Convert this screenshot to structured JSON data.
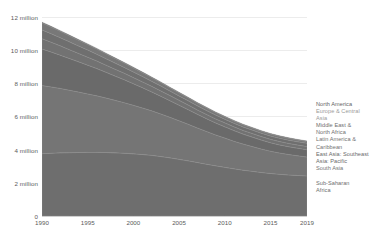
{
  "chart_data": {
    "type": "area",
    "title": "",
    "subtitle": "",
    "xlabel": "",
    "ylabel": "",
    "stacked": true,
    "grid": true,
    "legend_position": "right",
    "xlim": [
      1990,
      2019
    ],
    "ylim": [
      0,
      13000000
    ],
    "x_tick_labels": [
      "1990",
      "1995",
      "2000",
      "2005",
      "2010",
      "2015",
      "2019"
    ],
    "x_ticks": [
      1990,
      1995,
      2000,
      2005,
      2010,
      2015,
      2019
    ],
    "y_tick_labels": [
      "0",
      "2 million",
      "4 million",
      "6 million",
      "8 million",
      "10 million",
      "12 million"
    ],
    "y_ticks": [
      0,
      2000000,
      4000000,
      6000000,
      8000000,
      10000000,
      12000000
    ],
    "x": [
      1990,
      1991,
      1992,
      1993,
      1994,
      1995,
      1996,
      1997,
      1998,
      1999,
      2000,
      2001,
      2002,
      2003,
      2004,
      2005,
      2006,
      2007,
      2008,
      2009,
      2010,
      2011,
      2012,
      2013,
      2014,
      2015,
      2016,
      2017,
      2018,
      2019
    ],
    "series": [
      {
        "name": "Sub-Saharan Africa",
        "color": "#6e6e6e",
        "values": [
          3750000,
          3780000,
          3800000,
          3810000,
          3820000,
          3830000,
          3830000,
          3820000,
          3800000,
          3780000,
          3740000,
          3700000,
          3650000,
          3580000,
          3500000,
          3410000,
          3320000,
          3220000,
          3120000,
          3020000,
          2930000,
          2840000,
          2760000,
          2690000,
          2620000,
          2560000,
          2510000,
          2470000,
          2440000,
          2410000
        ]
      },
      {
        "name": "South Asia",
        "color": "#757575",
        "values": [
          4100000,
          3990000,
          3880000,
          3760000,
          3640000,
          3520000,
          3400000,
          3280000,
          3160000,
          3040000,
          2920000,
          2800000,
          2680000,
          2560000,
          2440000,
          2320000,
          2200000,
          2080000,
          1970000,
          1860000,
          1760000,
          1660000,
          1570000,
          1490000,
          1410000,
          1340000,
          1280000,
          1230000,
          1180000,
          1140000
        ]
      },
      {
        "name": "East Asia: Southeast Asia: Pacific",
        "color": "#6a6a6a",
        "values": [
          2200000,
          2100000,
          2000000,
          1910000,
          1820000,
          1730000,
          1640000,
          1550000,
          1460000,
          1380000,
          1300000,
          1220000,
          1140000,
          1070000,
          1000000,
          940000,
          880000,
          820000,
          770000,
          720000,
          680000,
          640000,
          600000,
          570000,
          540000,
          510000,
          490000,
          470000,
          455000,
          440000
        ]
      },
      {
        "name": "Latin America & Caribbean",
        "color": "#727272",
        "values": [
          620000,
          590000,
          560000,
          530000,
          505000,
          480000,
          455000,
          430000,
          410000,
          390000,
          370000,
          350000,
          335000,
          320000,
          305000,
          290000,
          278000,
          266000,
          255000,
          245000,
          236000,
          228000,
          221000,
          215000,
          209000,
          204000,
          200000,
          196000,
          193000,
          190000
        ]
      },
      {
        "name": "Middle East & North Africa",
        "color": "#6f6f6f",
        "values": [
          530000,
          510000,
          490000,
          470000,
          450000,
          430000,
          410000,
          390000,
          372000,
          354000,
          337000,
          320000,
          305000,
          291000,
          278000,
          266000,
          255000,
          245000,
          236000,
          228000,
          221000,
          215000,
          210000,
          206000,
          203000,
          201000,
          200000,
          199000,
          198000,
          197000
        ]
      },
      {
        "name": "Europe & Central Asia",
        "color": "#787878",
        "values": [
          420000,
          400000,
          382000,
          364000,
          346000,
          328000,
          310000,
          293000,
          277000,
          262000,
          247000,
          233000,
          220000,
          208000,
          197000,
          187000,
          177000,
          168000,
          160000,
          152000,
          145000,
          139000,
          133000,
          128000,
          123000,
          119000,
          115000,
          112000,
          109000,
          107000
        ]
      },
      {
        "name": "North America",
        "color": "#5f5f5f",
        "values": [
          45000,
          44000,
          43000,
          42000,
          41000,
          40000,
          39000,
          38500,
          38000,
          37500,
          37000,
          36500,
          36000,
          35500,
          35000,
          34500,
          34000,
          33500,
          33000,
          32500,
          32000,
          31500,
          31000,
          30500,
          30000,
          29800,
          29600,
          29400,
          29200,
          29000
        ]
      }
    ],
    "legend_entries": [
      {
        "label": "North America",
        "color": "#5f5f5f"
      },
      {
        "label": "Europe & Central\nAsia",
        "color": "#9a9a9a"
      },
      {
        "label": "Middle East &\nNorth Africa",
        "color": "#6f6f6f"
      },
      {
        "label": "Latin America &\nCaribbean",
        "color": "#727272"
      },
      {
        "label": "East Asia: Southeast\nAsia: Pacific",
        "color": "#6a6a6a"
      },
      {
        "label": "South Asia",
        "color": "#757575"
      },
      {
        "label": "Sub-Saharan\nAfrica",
        "color": "#6e6e6e"
      }
    ]
  }
}
